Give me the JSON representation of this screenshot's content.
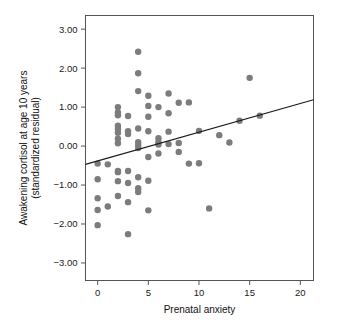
{
  "chart_data": {
    "type": "scatter",
    "title": "",
    "xlabel": "Prenatal anxiety",
    "ylabel": "Awakening cortisol at age 10 years (standardized residual)",
    "ylabel_line1": "Awakening cortisol at age 10 years",
    "ylabel_line2": "(standardized residual)",
    "xlim": [
      -1.2,
      21.3
    ],
    "ylim": [
      -3.45,
      3.35
    ],
    "xticks": [
      0,
      5,
      10,
      15,
      20
    ],
    "xtick_labels": [
      "0",
      "5",
      "10",
      "15",
      "20"
    ],
    "yticks": [
      3,
      2,
      1,
      0,
      -1,
      -2,
      -3
    ],
    "ytick_labels": [
      "3.00",
      "2.00",
      "1.00",
      "0.00",
      "-1.00",
      "-2.00",
      "-3.00"
    ],
    "grid": false,
    "legend": false,
    "point_color": "#7c7c7c",
    "point_radius": 3.2,
    "line_color": "#1b1b1b",
    "frame_color": "#555555",
    "trendline": {
      "name": "linear fit",
      "x_start": -1.2,
      "y_start": -0.47,
      "x_end": 21.3,
      "y_end": 1.19,
      "slope": 0.0738,
      "intercept": -0.381
    },
    "points": [
      [
        0,
        -0.45
      ],
      [
        0,
        -0.85
      ],
      [
        0,
        -1.34
      ],
      [
        0,
        -1.64
      ],
      [
        0,
        -2.03
      ],
      [
        1,
        -0.47
      ],
      [
        1,
        -1.55
      ],
      [
        2,
        1.0
      ],
      [
        2,
        0.86
      ],
      [
        2,
        0.79
      ],
      [
        2,
        0.52
      ],
      [
        2,
        0.44
      ],
      [
        2,
        0.34
      ],
      [
        2,
        0.19
      ],
      [
        2,
        0.07
      ],
      [
        2,
        -0.64
      ],
      [
        2,
        -0.67
      ],
      [
        2,
        -0.9
      ],
      [
        2,
        -1.28
      ],
      [
        3,
        0.77
      ],
      [
        3,
        0.38
      ],
      [
        3,
        0.31
      ],
      [
        3,
        -0.64
      ],
      [
        3,
        -0.95
      ],
      [
        3,
        -1.44
      ],
      [
        3,
        -2.26
      ],
      [
        4,
        2.42
      ],
      [
        4,
        1.87
      ],
      [
        4,
        1.41
      ],
      [
        4,
        0.45
      ],
      [
        4,
        0.1
      ],
      [
        4,
        0.03
      ],
      [
        4,
        -0.05
      ],
      [
        4,
        -0.8
      ],
      [
        4,
        -1.08
      ],
      [
        4,
        -1.18
      ],
      [
        5,
        1.29
      ],
      [
        5,
        1.03
      ],
      [
        5,
        0.75
      ],
      [
        5,
        0.38
      ],
      [
        5,
        -0.28
      ],
      [
        5,
        -0.89
      ],
      [
        5,
        -1.65
      ],
      [
        6,
        1.0
      ],
      [
        6,
        0.2
      ],
      [
        6,
        0.1
      ],
      [
        6,
        0.04
      ],
      [
        6,
        -0.19
      ],
      [
        7,
        1.35
      ],
      [
        7,
        0.84
      ],
      [
        7,
        0.37
      ],
      [
        7,
        0.05
      ],
      [
        8,
        1.11
      ],
      [
        8,
        0.08
      ],
      [
        8,
        -0.15
      ],
      [
        9,
        1.12
      ],
      [
        9,
        -0.45
      ],
      [
        10,
        0.39
      ],
      [
        10,
        -0.44
      ],
      [
        11,
        -1.6
      ],
      [
        12,
        0.28
      ],
      [
        13,
        0.09
      ],
      [
        14,
        0.65
      ],
      [
        15,
        1.75
      ],
      [
        16,
        0.78
      ]
    ]
  }
}
